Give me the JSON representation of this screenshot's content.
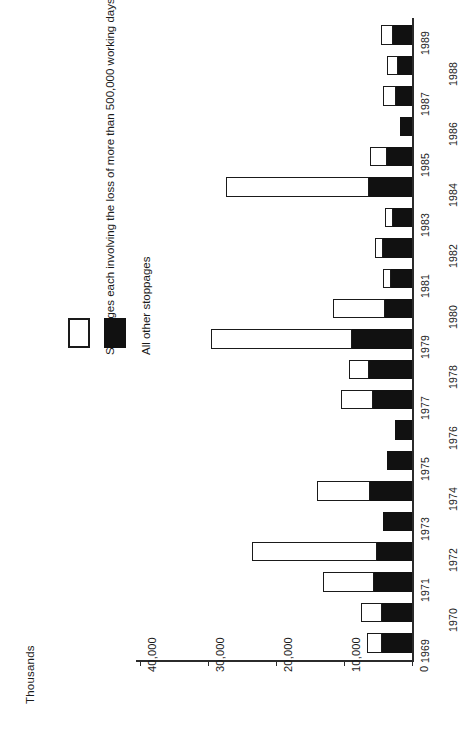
{
  "chart_data": {
    "type": "bar",
    "orientation": "horizontal-rotated",
    "title": "",
    "subtitle": "",
    "units_label": "Thousands",
    "xlabel": "",
    "ylabel": "Thousands",
    "grid": false,
    "legend_position": "left",
    "value_axis": {
      "label": "Thousands",
      "ticks": [
        0,
        10000,
        20000,
        30000,
        40000
      ],
      "tick_labels": [
        "0",
        "10,000",
        "20,000",
        "30,000",
        "40,000"
      ],
      "range": [
        0,
        40000
      ]
    },
    "categories": [
      "1969",
      "1970",
      "1971",
      "1972",
      "1973",
      "1974",
      "1975",
      "1976",
      "1977",
      "1978",
      "1979",
      "1980",
      "1981",
      "1982",
      "1983",
      "1984",
      "1985",
      "1986",
      "1987",
      "1988",
      "1989"
    ],
    "series": [
      {
        "name": "All other stoppages",
        "color": "#111111",
        "values": [
          4500,
          4500,
          5600,
          5200,
          4400,
          6200,
          3700,
          2600,
          5800,
          6400,
          8900,
          4100,
          3200,
          4400,
          2800,
          6400,
          3800,
          1900,
          2400,
          2100,
          2800
        ]
      },
      {
        "name": "Stoppages each involving the loss of more than 500,000 working days",
        "color": "#ffffff",
        "values": [
          2200,
          3100,
          7500,
          18400,
          0,
          7900,
          0,
          0,
          4700,
          3000,
          20700,
          7600,
          1100,
          1100,
          1200,
          21000,
          2500,
          0,
          1900,
          1700,
          1900
        ]
      }
    ],
    "totals": [
      6700,
      7600,
      13100,
      23600,
      4400,
      14100,
      3700,
      2600,
      10500,
      9400,
      29600,
      11700,
      4300,
      5500,
      4000,
      27400,
      6300,
      1900,
      4300,
      3800,
      4700
    ]
  },
  "legend": {
    "items": [
      {
        "key": "large-stoppages",
        "label": "Stoppages each involving the loss of more than 500,000 working days",
        "swatch": "white"
      },
      {
        "key": "other-stoppages",
        "label": "All other stoppages",
        "swatch": "black"
      }
    ]
  },
  "axis": {
    "units_title": "Thousands",
    "tick_labels": [
      "40,000",
      "30,000",
      "20,000",
      "10,000",
      "0"
    ]
  },
  "year_labels": [
    "1969",
    "1970",
    "1971",
    "1972",
    "1973",
    "1974",
    "1975",
    "1976",
    "1977",
    "1978",
    "1979",
    "1980",
    "1981",
    "1982",
    "1983",
    "1984",
    "1985",
    "1986",
    "1987",
    "1988",
    "1989"
  ]
}
